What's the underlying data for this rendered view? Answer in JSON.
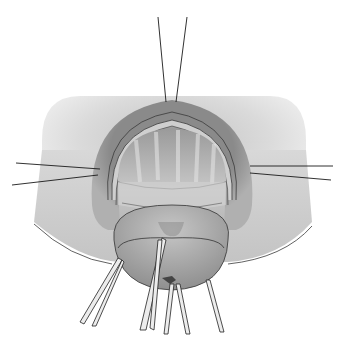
{
  "illustration": {
    "style": "grayscale surgical illustration",
    "subject": "retracted tissue with stay sutures and clamps",
    "colors": {
      "background": "#ffffff",
      "skin": "#d2d2d2",
      "skin_dark": "#a9a9a9",
      "ring_outer": "#8e8e8e",
      "ring_inner": "#c9c9c9",
      "tissue": "#b5b5b5",
      "tissue_light": "#dedede",
      "line": "#2a2a2a",
      "instrument": "#e8e8e8"
    },
    "sutures": [
      {
        "name": "top-left",
        "x1": 158,
        "y1": 17,
        "x2": 166,
        "y2": 102
      },
      {
        "name": "top-right",
        "x1": 187,
        "y1": 17,
        "x2": 176,
        "y2": 102
      },
      {
        "name": "left-1",
        "x1": 16,
        "y1": 163,
        "x2": 100,
        "y2": 169
      },
      {
        "name": "left-2",
        "x1": 12,
        "y1": 185,
        "x2": 98,
        "y2": 175
      },
      {
        "name": "right-1",
        "x1": 250,
        "y1": 166,
        "x2": 333,
        "y2": 166
      },
      {
        "name": "right-2",
        "x1": 250,
        "y1": 173,
        "x2": 331,
        "y2": 180
      }
    ],
    "clamps": [
      {
        "name": "clamp-far-left"
      },
      {
        "name": "clamp-left"
      },
      {
        "name": "clamp-center-left"
      },
      {
        "name": "clamp-center-right"
      },
      {
        "name": "clamp-right"
      }
    ]
  }
}
